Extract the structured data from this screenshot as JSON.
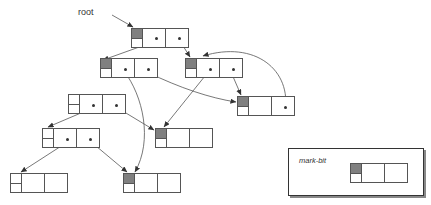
{
  "figure": {
    "width": 431,
    "height": 205,
    "background": "#ffffff",
    "line_color": "#555555",
    "mark_fill": "#808080",
    "unmarked_fill": "#ffffff",
    "dot_color": "#333333"
  },
  "labels": {
    "root": "root",
    "mark_bit": "mark-bit"
  },
  "legend": {
    "caption": "mark-bit",
    "node": {
      "marked": true,
      "cells": 2
    }
  },
  "nodes": [
    {
      "id": "root",
      "label": "root-node",
      "x": 131,
      "y": 28,
      "w": 58,
      "h": 20,
      "marked": true,
      "cells": 2,
      "dots": [
        1,
        2
      ]
    },
    {
      "id": "n-l1",
      "label": "level2-left-node",
      "x": 100,
      "y": 58,
      "w": 58,
      "h": 20,
      "marked": true,
      "cells": 2,
      "dots": [
        1,
        2
      ]
    },
    {
      "id": "n-r1",
      "label": "level2-right-node",
      "x": 185,
      "y": 58,
      "w": 58,
      "h": 20,
      "marked": true,
      "cells": 2,
      "dots": [
        1,
        2
      ]
    },
    {
      "id": "n-l2",
      "label": "level3-left-node",
      "x": 68,
      "y": 94,
      "w": 58,
      "h": 20,
      "marked": false,
      "cells": 2,
      "dots": [
        1,
        2
      ]
    },
    {
      "id": "n-r2",
      "label": "right-leaf-node",
      "x": 237,
      "y": 96,
      "w": 58,
      "h": 20,
      "marked": true,
      "cells": 2,
      "dots": [
        2
      ]
    },
    {
      "id": "n-l3",
      "label": "level4-left-node",
      "x": 42,
      "y": 128,
      "w": 58,
      "h": 20,
      "marked": false,
      "cells": 2,
      "dots": [
        1,
        2
      ]
    },
    {
      "id": "n-mid",
      "label": "middle-leaf-node",
      "x": 155,
      "y": 128,
      "w": 58,
      "h": 20,
      "marked": true,
      "cells": 2,
      "dots": []
    },
    {
      "id": "n-bl",
      "label": "bottom-left-node",
      "x": 10,
      "y": 173,
      "w": 58,
      "h": 20,
      "marked": false,
      "cells": 2,
      "dots": []
    },
    {
      "id": "n-bm",
      "label": "bottom-middle-node",
      "x": 123,
      "y": 173,
      "w": 58,
      "h": 20,
      "marked": true,
      "cells": 2,
      "dots": []
    }
  ],
  "edges": [
    {
      "from": "root-left-cell",
      "to": "n-l1",
      "kind": "straight"
    },
    {
      "from": "root-right-cell",
      "to": "n-r1",
      "kind": "straight"
    },
    {
      "from": "n-l1-left-cell",
      "to": "n-bm",
      "kind": "curve"
    },
    {
      "from": "n-l1-right-cell",
      "to": "n-r2",
      "kind": "curve"
    },
    {
      "from": "n-r1-left-cell",
      "to": "n-mid",
      "kind": "straight"
    },
    {
      "from": "n-r1-right-cell",
      "to": "n-r2",
      "kind": "straight"
    },
    {
      "from": "n-r2-right-cell",
      "to": "n-r1",
      "kind": "curve"
    },
    {
      "from": "n-l2-left-cell",
      "to": "n-l3",
      "kind": "straight"
    },
    {
      "from": "n-l2-right-cell",
      "to": "n-mid",
      "kind": "straight"
    },
    {
      "from": "n-l3-left-cell",
      "to": "n-bl",
      "kind": "straight"
    },
    {
      "from": "n-l3-right-cell",
      "to": "n-bm",
      "kind": "straight"
    },
    {
      "from": "root-label",
      "to": "root",
      "kind": "leader"
    },
    {
      "from": "mark-bit-label",
      "to": "legend-node-markbit",
      "kind": "leader"
    }
  ]
}
